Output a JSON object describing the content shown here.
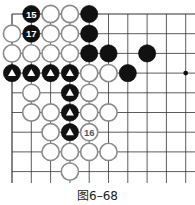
{
  "caption": "图6–68",
  "board": {
    "cols": 10,
    "rows": 9,
    "origin_x": 12,
    "origin_y": 14,
    "spacing_x": 19.3,
    "spacing_y": 19.7,
    "top_edge": true,
    "left_edge": true,
    "line_color": "#333333",
    "star_points": [
      [
        9,
        3
      ]
    ],
    "stones": [
      {
        "c": 1,
        "r": 0,
        "color": "black",
        "label": "15"
      },
      {
        "c": 2,
        "r": 0,
        "color": "white"
      },
      {
        "c": 3,
        "r": 0,
        "color": "white"
      },
      {
        "c": 4,
        "r": 0,
        "color": "black"
      },
      {
        "c": 0,
        "r": 1,
        "color": "white"
      },
      {
        "c": 1,
        "r": 1,
        "color": "black",
        "label": "17"
      },
      {
        "c": 2,
        "r": 1,
        "color": "white"
      },
      {
        "c": 3,
        "r": 1,
        "color": "white"
      },
      {
        "c": 4,
        "r": 1,
        "color": "black"
      },
      {
        "c": 0,
        "r": 2,
        "color": "white"
      },
      {
        "c": 1,
        "r": 2,
        "color": "white"
      },
      {
        "c": 2,
        "r": 2,
        "color": "white"
      },
      {
        "c": 3,
        "r": 2,
        "color": "white"
      },
      {
        "c": 4,
        "r": 2,
        "color": "black"
      },
      {
        "c": 5,
        "r": 2,
        "color": "black"
      },
      {
        "c": 7,
        "r": 2,
        "color": "black"
      },
      {
        "c": 0,
        "r": 3,
        "color": "black",
        "mark": "triangle"
      },
      {
        "c": 1,
        "r": 3,
        "color": "black",
        "mark": "triangle"
      },
      {
        "c": 2,
        "r": 3,
        "color": "black",
        "mark": "triangle"
      },
      {
        "c": 3,
        "r": 3,
        "color": "black",
        "mark": "triangle"
      },
      {
        "c": 4,
        "r": 3,
        "color": "white"
      },
      {
        "c": 5,
        "r": 3,
        "color": "white"
      },
      {
        "c": 6,
        "r": 3,
        "color": "black"
      },
      {
        "c": 1,
        "r": 4,
        "color": "white"
      },
      {
        "c": 3,
        "r": 4,
        "color": "black",
        "mark": "triangle"
      },
      {
        "c": 4,
        "r": 4,
        "color": "white"
      },
      {
        "c": 1,
        "r": 5,
        "color": "white"
      },
      {
        "c": 2,
        "r": 5,
        "color": "white"
      },
      {
        "c": 3,
        "r": 5,
        "color": "black",
        "mark": "triangle"
      },
      {
        "c": 4,
        "r": 5,
        "color": "white"
      },
      {
        "c": 5,
        "r": 5,
        "color": "white"
      },
      {
        "c": 2,
        "r": 6,
        "color": "white"
      },
      {
        "c": 3,
        "r": 6,
        "color": "black",
        "mark": "triangle"
      },
      {
        "c": 4,
        "r": 6,
        "color": "white",
        "label": "16"
      },
      {
        "c": 2,
        "r": 7,
        "color": "white"
      },
      {
        "c": 3,
        "r": 7,
        "color": "white"
      },
      {
        "c": 4,
        "r": 7,
        "color": "white"
      },
      {
        "c": 5,
        "r": 7,
        "color": "white"
      },
      {
        "c": 3,
        "r": 8,
        "color": "white"
      }
    ]
  }
}
